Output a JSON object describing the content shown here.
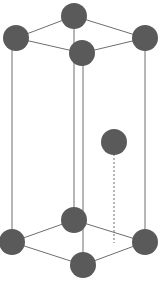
{
  "diagram": {
    "type": "crystal-unit-cell",
    "colors": {
      "atom": "#5a5a5a",
      "edge": "#6e6e6e",
      "background": "#ffffff"
    },
    "atoms": {
      "top": [
        {
          "name": "top-back",
          "cx": 74,
          "cy": 16
        },
        {
          "name": "top-left",
          "cx": 16,
          "cy": 38
        },
        {
          "name": "top-right",
          "cx": 145,
          "cy": 38
        },
        {
          "name": "top-front",
          "cx": 82,
          "cy": 53
        }
      ],
      "interior": {
        "name": "interior",
        "cx": 114,
        "cy": 142
      },
      "bottom": [
        {
          "name": "bottom-back",
          "cx": 74,
          "cy": 220
        },
        {
          "name": "bottom-left",
          "cx": 12,
          "cy": 242
        },
        {
          "name": "bottom-right",
          "cx": 145,
          "cy": 242
        },
        {
          "name": "bottom-front",
          "cx": 83,
          "cy": 265
        }
      ],
      "radius": 13
    }
  }
}
